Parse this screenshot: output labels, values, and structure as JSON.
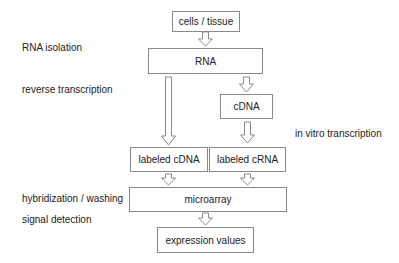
{
  "diagram": {
    "type": "flowchart",
    "boxes": {
      "cells": "cells / tissue",
      "rna": "RNA",
      "cdna": "cDNA",
      "labeled_cdna": "labeled cDNA",
      "labeled_crna": "labeled cRNA",
      "microarray": "microarray",
      "expression": "expression values"
    },
    "step_labels": {
      "rna_isolation": "RNA isolation",
      "reverse_transcription": "reverse transcription",
      "in_vitro_transcription": "in vitro transcription",
      "hybridization": "hybridization / washing",
      "signal_detection": "signal detection"
    },
    "edges": [
      {
        "from": "cells / tissue",
        "to": "RNA"
      },
      {
        "from": "RNA",
        "to": "labeled cDNA"
      },
      {
        "from": "RNA",
        "to": "cDNA"
      },
      {
        "from": "cDNA",
        "to": "labeled cRNA"
      },
      {
        "from": "labeled cDNA",
        "to": "microarray"
      },
      {
        "from": "labeled cRNA",
        "to": "microarray"
      },
      {
        "from": "microarray",
        "to": "expression values"
      }
    ],
    "colors": {
      "border": "#8a8a8a",
      "text": "#222222",
      "arrow": "#8a8a8a"
    }
  }
}
